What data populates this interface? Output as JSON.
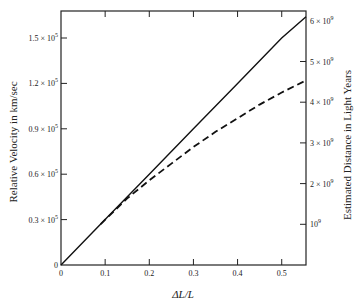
{
  "chart_data": {
    "type": "line",
    "title": "",
    "xlabel": "ΔL/L",
    "ylabel": "Relative Velocity in km/sec",
    "y2label": "Estimated Distance in Light Years",
    "xlim": [
      0,
      0.555
    ],
    "ylim": [
      0,
      166000.0
    ],
    "y2lim": [
      0,
      6100000000.0
    ],
    "grid": false,
    "legend": null,
    "x_ticks": [
      {
        "value": 0,
        "label": "0"
      },
      {
        "value": 0.1,
        "label": "0.1"
      },
      {
        "value": 0.2,
        "label": "0.2"
      },
      {
        "value": 0.3,
        "label": "0.3"
      },
      {
        "value": 0.4,
        "label": "0.4"
      },
      {
        "value": 0.5,
        "label": "0.5"
      }
    ],
    "y_ticks": [
      {
        "value": 0,
        "label": "0",
        "mant": "",
        "exp": ""
      },
      {
        "value": 30000,
        "label": "0.3 × 10^5",
        "mant": "0.3 × 10",
        "exp": "5"
      },
      {
        "value": 60000,
        "label": "0.6 × 10^5",
        "mant": "0.6 × 10",
        "exp": "5"
      },
      {
        "value": 90000,
        "label": "0.9 × 10^5",
        "mant": "0.9 × 10",
        "exp": "5"
      },
      {
        "value": 120000,
        "label": "1.2 × 10^5",
        "mant": "1.2 × 10",
        "exp": "5"
      },
      {
        "value": 150000,
        "label": "1.5 × 10^5",
        "mant": "1.5 × 10",
        "exp": "5"
      }
    ],
    "y2_ticks": [
      {
        "value": 1000000000.0,
        "label": "10^9",
        "mant": "10",
        "exp": "9"
      },
      {
        "value": 2000000000.0,
        "label": "2 × 10^9",
        "mant": "2 × 10",
        "exp": "9"
      },
      {
        "value": 3000000000.0,
        "label": "3 × 10^9",
        "mant": "3 × 10",
        "exp": "9"
      },
      {
        "value": 4000000000.0,
        "label": "4 × 10^9",
        "mant": "4 × 10",
        "exp": "9"
      },
      {
        "value": 5000000000.0,
        "label": "5 × 10^9",
        "mant": "5 × 10",
        "exp": "9"
      },
      {
        "value": 6000000000.0,
        "label": "6 × 10^9",
        "mant": "6 × 10",
        "exp": "9"
      }
    ],
    "series": [
      {
        "name": "linear (v = c·ΔL/L)",
        "style": "solid",
        "x": [
          0,
          0.1,
          0.2,
          0.3,
          0.4,
          0.5,
          0.555
        ],
        "y": [
          0,
          30000,
          60000,
          90000,
          120000,
          150000,
          164000
        ]
      },
      {
        "name": "estimated (curved)",
        "style": "dashed",
        "x": [
          0.09,
          0.15,
          0.2,
          0.25,
          0.3,
          0.35,
          0.4,
          0.45,
          0.5,
          0.555
        ],
        "y": [
          27000,
          44000,
          56000,
          67000,
          78000,
          88000,
          97000,
          106000,
          114000,
          122000
        ]
      }
    ]
  }
}
